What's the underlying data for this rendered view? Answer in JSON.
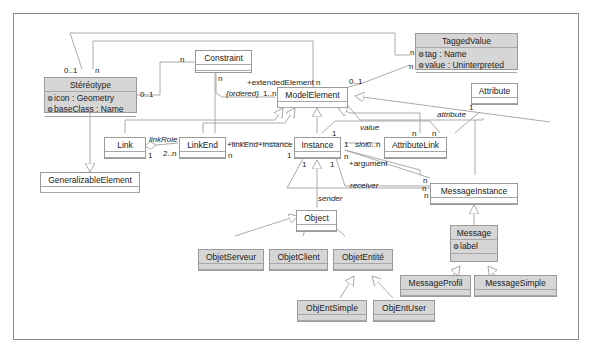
{
  "diagram": {
    "type": "UML class diagram",
    "classes": [
      {
        "id": "stereotype",
        "name": "Stéréotype",
        "attributes": [
          "icon : Geometry",
          "baseClass : Name"
        ],
        "shaded": true
      },
      {
        "id": "constraint",
        "name": "Constraint",
        "attributes": [],
        "shaded": false
      },
      {
        "id": "taggedvalue",
        "name": "TaggedValue",
        "attributes": [
          "tag : Name",
          "value : Uninterpreted"
        ],
        "shaded": true
      },
      {
        "id": "modelelement",
        "name": "ModelElement",
        "attributes": [],
        "shaded": false
      },
      {
        "id": "attribute",
        "name": "Attribute",
        "attributes": [],
        "shaded": false
      },
      {
        "id": "link",
        "name": "Link",
        "attributes": [],
        "shaded": false
      },
      {
        "id": "linkend",
        "name": "LinkEnd",
        "attributes": [],
        "shaded": false
      },
      {
        "id": "instance",
        "name": "Instance",
        "attributes": [],
        "shaded": false
      },
      {
        "id": "attributelink",
        "name": "AttributeLink",
        "attributes": [],
        "shaded": false
      },
      {
        "id": "generalizable",
        "name": "GeneralizableElement",
        "attributes": [],
        "shaded": false
      },
      {
        "id": "messageinstance",
        "name": "MessageInstance",
        "attributes": [],
        "shaded": false
      },
      {
        "id": "object",
        "name": "Object",
        "attributes": [],
        "shaded": false
      },
      {
        "id": "message",
        "name": "Message",
        "attributes": [
          "label"
        ],
        "shaded": true
      },
      {
        "id": "objetserveur",
        "name": "ObjetServeur",
        "attributes": [],
        "shaded": true
      },
      {
        "id": "objetclient",
        "name": "ObjetClient",
        "attributes": [],
        "shaded": true
      },
      {
        "id": "objetentite",
        "name": "ObjetEntité",
        "attributes": [],
        "shaded": true
      },
      {
        "id": "messageprofil",
        "name": "MessageProfil",
        "attributes": [],
        "shaded": true
      },
      {
        "id": "messagesimple",
        "name": "MessageSimple",
        "attributes": [],
        "shaded": true
      },
      {
        "id": "objentsimple",
        "name": "ObjEntSimple",
        "attributes": [],
        "shaded": true
      },
      {
        "id": "objentuser",
        "name": "ObjEntUser",
        "attributes": [],
        "shaded": true
      }
    ],
    "labels": {
      "stereo_01": "0..1",
      "stereo_n": "n",
      "stereo_right_01": "0..1",
      "constraint_n_left": "n",
      "constraint_n_bottom": "n",
      "ordered": "{ordered}",
      "ordered_mult": "1..n",
      "extended_element": "+extendedElement",
      "extended_n": "n",
      "tv_01": "0..1",
      "tv_n_top": "n",
      "tv_n_bottom": "n",
      "link_role": "linkRole",
      "link_1": "1",
      "linkend_2n": "2..n",
      "linkend_role": "+linkEnd",
      "linkend_n": "n",
      "instance_role": "+instance",
      "instance_1_left": "1",
      "instance_1_top": "1",
      "instance_1_right": "1",
      "instance_1_bl": "1",
      "instance_1_br": "1",
      "instance_n_arg": "n",
      "argument": "+argument",
      "slot": "slot",
      "slot_mult": "0..n",
      "value": "value",
      "attribute_role": "attribute",
      "attribute_1": "1",
      "al_n1": "n",
      "al_n2": "n",
      "mi_n1": "n",
      "mi_n2": "n",
      "mi_n3": "n",
      "receiver": "receiver",
      "sender": "sender"
    }
  }
}
